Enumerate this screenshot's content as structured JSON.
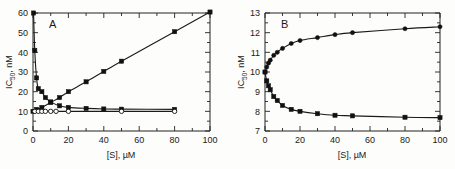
{
  "figure": {
    "background": "#fdfdfc",
    "ink_color": "#1a1a1a"
  },
  "panelA": {
    "letter": "A",
    "ylabel_main": "IC",
    "ylabel_sub": "50",
    "ylabel_tail": ", nM",
    "xlabel_main": "[S], ",
    "xlabel_unit": "µM",
    "ticklabels": {
      "x": [
        "0",
        "20",
        "40",
        "60",
        "80",
        "100"
      ],
      "y": [
        "0",
        "10",
        "20",
        "30",
        "40",
        "50",
        "60"
      ]
    }
  },
  "panelB": {
    "letter": "B",
    "ylabel_main": "IC",
    "ylabel_sub": "50",
    "ylabel_tail": ", nM",
    "xlabel_main": "[S], ",
    "xlabel_unit": "µM",
    "ticklabels": {
      "x": [
        "0",
        "20",
        "40",
        "60",
        "80",
        "100"
      ],
      "y": [
        "7",
        "8",
        "9",
        "10",
        "11",
        "12",
        "13"
      ]
    }
  },
  "chart_data": [
    {
      "type": "line",
      "panel": "A",
      "title": "A",
      "xlabel": "[S], µM",
      "ylabel": "IC50, nM",
      "xlim": [
        0,
        100
      ],
      "ylim": [
        0,
        60
      ],
      "xticks": [
        0,
        20,
        40,
        60,
        80,
        100
      ],
      "yticks": [
        0,
        10,
        20,
        30,
        40,
        50,
        60
      ],
      "minor_xtick_interval": 10,
      "minor_ytick_interval": 5,
      "grid": false,
      "legend": false,
      "series": [
        {
          "name": "linear-increase",
          "marker": "filled-square",
          "x": [
            0,
            2,
            5,
            10,
            15,
            20,
            30,
            40,
            50,
            80,
            100
          ],
          "y": [
            10.0,
            11.0,
            12.0,
            14.5,
            17.0,
            20.0,
            25.0,
            30.3,
            35.5,
            50.5,
            60.5
          ]
        },
        {
          "name": "steep-decay",
          "marker": "filled-square",
          "x": [
            0.3,
            1,
            2,
            3,
            5,
            7,
            10,
            15,
            20,
            30,
            40,
            50,
            80
          ],
          "y": [
            60.0,
            41.0,
            27.0,
            21.5,
            20.0,
            17.0,
            14.8,
            12.8,
            12.0,
            11.5,
            11.2,
            11.1,
            11.0
          ]
        },
        {
          "name": "flat-open-circles",
          "marker": "open-circle",
          "x": [
            1,
            3,
            5,
            7,
            10,
            13,
            20,
            50,
            80
          ],
          "y": [
            10.0,
            10.0,
            10.0,
            10.0,
            10.0,
            10.0,
            10.0,
            10.0,
            10.0
          ]
        }
      ]
    },
    {
      "type": "line",
      "panel": "B",
      "title": "B",
      "xlabel": "[S], µM",
      "ylabel": "IC50, nM",
      "xlim": [
        0,
        100
      ],
      "ylim": [
        7,
        13
      ],
      "xticks": [
        0,
        20,
        40,
        60,
        80,
        100
      ],
      "yticks": [
        7,
        8,
        9,
        10,
        11,
        12,
        13
      ],
      "minor_xtick_interval": 10,
      "minor_ytick_interval": 0.5,
      "grid": false,
      "legend": false,
      "series": [
        {
          "name": "upper-saturating",
          "marker": "filled-circle",
          "x": [
            0,
            1,
            2,
            3,
            5,
            7,
            10,
            15,
            20,
            30,
            40,
            50,
            80,
            100
          ],
          "y": [
            10.0,
            10.25,
            10.45,
            10.6,
            10.85,
            11.0,
            11.2,
            11.45,
            11.6,
            11.75,
            11.9,
            12.0,
            12.2,
            12.3
          ]
        },
        {
          "name": "lower-saturating",
          "marker": "filled-square",
          "x": [
            0,
            1,
            2,
            3,
            5,
            7,
            10,
            15,
            20,
            30,
            40,
            50,
            80,
            100
          ],
          "y": [
            10.0,
            9.55,
            9.3,
            9.1,
            8.75,
            8.55,
            8.3,
            8.1,
            8.0,
            7.88,
            7.8,
            7.77,
            7.7,
            7.68
          ]
        }
      ]
    }
  ]
}
